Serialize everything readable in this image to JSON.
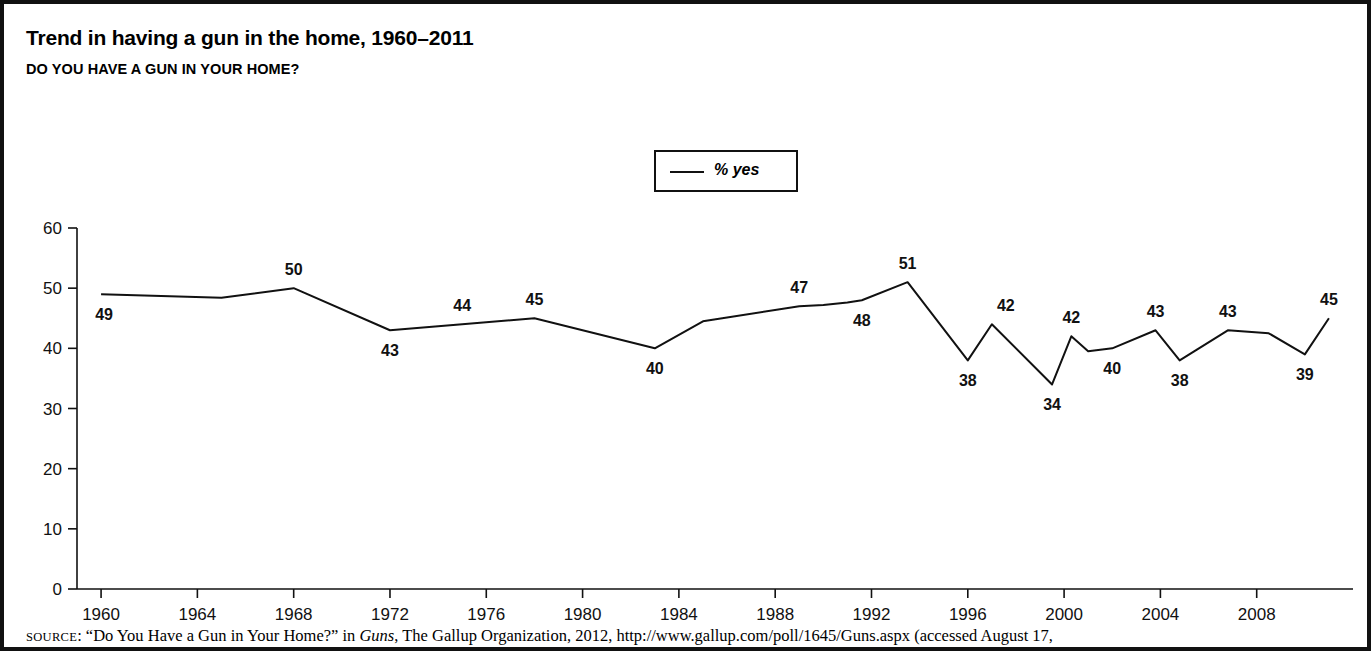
{
  "figure": {
    "title": "Trend in having a gun in the home, 1960–2011",
    "subtitle": "DO YOU HAVE A GUN IN YOUR HOME?",
    "border_color": "#111111",
    "background": "#ffffff"
  },
  "legend": {
    "label": "% yes",
    "position": "top-center",
    "line_color": "#111111"
  },
  "source": {
    "keyword": "SOURCE",
    "text_before_italic": ": “Do You Have a Gun in Your Home?” in ",
    "italic_title": "Guns",
    "text_after_italic": ", The Gallup Organization, 2012, http://www.gallup.com/poll/1645/Guns.aspx (accessed August 17,"
  },
  "chart_data": {
    "type": "line",
    "title": "Trend in having a gun in the home, 1960–2011",
    "subtitle": "DO YOU HAVE A GUN IN YOUR HOME?",
    "xlabel": "",
    "ylabel": "",
    "xlim": [
      1959,
      2012
    ],
    "ylim": [
      0,
      60
    ],
    "ytick_values": [
      0,
      10,
      20,
      30,
      40,
      50,
      60
    ],
    "ytick_labels": [
      "0",
      "10",
      "20",
      "30",
      "40",
      "50",
      "60"
    ],
    "xtick_values": [
      1960,
      1964,
      1968,
      1972,
      1976,
      1980,
      1984,
      1988,
      1992,
      1996,
      2000,
      2004,
      2008
    ],
    "xtick_labels": [
      "1960",
      "1964",
      "1968",
      "1972",
      "1976",
      "1980",
      "1984",
      "1988",
      "1992",
      "1996",
      "2000",
      "2004",
      "2008"
    ],
    "grid": false,
    "legend_position": "top-center",
    "series": [
      {
        "name": "% yes",
        "color": "#111111",
        "x": [
          1960,
          1965,
          1968,
          1972,
          1975,
          1978,
          1983,
          1985,
          1989,
          1990,
          1991,
          1991.6,
          1993.5,
          1996,
          1997,
          1999.5,
          2000.3,
          2001,
          2002,
          2003.8,
          2004.8,
          2006.8,
          2008.5,
          2010,
          2011
        ],
        "y": [
          49,
          48.4,
          50,
          43,
          44,
          45,
          40,
          44.5,
          47,
          47.2,
          47.6,
          48,
          51,
          38,
          44,
          34,
          42,
          39.5,
          40,
          43,
          38,
          43,
          42.5,
          39,
          45
        ],
        "labeled_points": [
          {
            "x": 1960,
            "y": 49,
            "label": "49",
            "pos": "below-right"
          },
          {
            "x": 1968,
            "y": 50,
            "label": "50",
            "pos": "above"
          },
          {
            "x": 1972,
            "y": 43,
            "label": "43",
            "pos": "below"
          },
          {
            "x": 1975,
            "y": 44,
            "label": "44",
            "pos": "above"
          },
          {
            "x": 1978,
            "y": 45,
            "label": "45",
            "pos": "above"
          },
          {
            "x": 1983,
            "y": 40,
            "label": "40",
            "pos": "below"
          },
          {
            "x": 1989,
            "y": 47,
            "label": "47",
            "pos": "above"
          },
          {
            "x": 1991.6,
            "y": 48,
            "label": "48",
            "pos": "below"
          },
          {
            "x": 1993.5,
            "y": 51,
            "label": "51",
            "pos": "above"
          },
          {
            "x": 1996,
            "y": 38,
            "label": "38",
            "pos": "below"
          },
          {
            "x": 1997,
            "y": 44,
            "label": "42",
            "pos": "above-right"
          },
          {
            "x": 1999.5,
            "y": 34,
            "label": "34",
            "pos": "below"
          },
          {
            "x": 2000.3,
            "y": 42,
            "label": "42",
            "pos": "above"
          },
          {
            "x": 2002,
            "y": 40,
            "label": "40",
            "pos": "below"
          },
          {
            "x": 2003.8,
            "y": 43,
            "label": "43",
            "pos": "above"
          },
          {
            "x": 2004.8,
            "y": 38,
            "label": "38",
            "pos": "below"
          },
          {
            "x": 2006.8,
            "y": 43,
            "label": "43",
            "pos": "above"
          },
          {
            "x": 2010,
            "y": 39,
            "label": "39",
            "pos": "below"
          },
          {
            "x": 2011,
            "y": 45,
            "label": "45",
            "pos": "above"
          }
        ]
      }
    ]
  }
}
